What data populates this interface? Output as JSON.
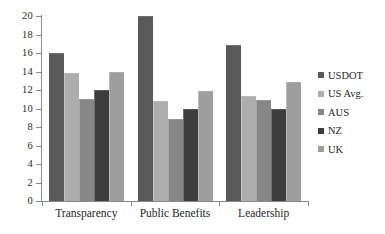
{
  "chart_data": {
    "type": "bar",
    "title": "",
    "subtitle": "",
    "xlabel": "",
    "ylabel": "",
    "ylim": [
      0,
      20
    ],
    "ytick_step": 2,
    "ytick_labels": [
      "20",
      "18",
      "16",
      "14",
      "12",
      "10",
      "8",
      "6",
      "4",
      "2",
      "0"
    ],
    "grid": false,
    "legend_position": "right",
    "categories": [
      "Transparency",
      "Public Benefits",
      "Leadership"
    ],
    "series": [
      {
        "name": "USDOT",
        "color": "#595959",
        "values": [
          16.0,
          20.0,
          16.9
        ]
      },
      {
        "name": "US Avg.",
        "color": "#adadad",
        "values": [
          13.8,
          10.8,
          11.4
        ]
      },
      {
        "name": "AUS",
        "color": "#878787",
        "values": [
          11.0,
          8.9,
          10.9
        ]
      },
      {
        "name": "NZ",
        "color": "#3d3d3d",
        "values": [
          12.0,
          10.0,
          9.9
        ]
      },
      {
        "name": "UK",
        "color": "#9e9e9e",
        "values": [
          14.0,
          11.9,
          12.9
        ]
      }
    ]
  },
  "axis": {
    "line_color": "#8a8a8a"
  }
}
